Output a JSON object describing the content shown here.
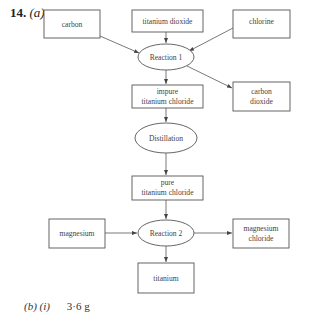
{
  "question": {
    "number": "14.",
    "part": "(a)"
  },
  "diagram": {
    "nodes": {
      "carbon": {
        "label_lines": [
          "carbon"
        ],
        "shape": "box"
      },
      "titanium_dioxide": {
        "label_lines": [
          "titanium dioxide"
        ],
        "shape": "box"
      },
      "chlorine": {
        "label_lines": [
          "chlorine"
        ],
        "shape": "box"
      },
      "reaction1": {
        "label_lines": [
          "Reaction 1"
        ],
        "shape": "ellipse"
      },
      "impure_ticl": {
        "label_lines": [
          "impure",
          "titanium chloride"
        ],
        "shape": "box"
      },
      "carbon_dioxide": {
        "label_lines": [
          "carbon",
          "dioxide"
        ],
        "shape": "box"
      },
      "distillation": {
        "label_lines": [
          "Distillation"
        ],
        "shape": "ellipse"
      },
      "pure_ticl": {
        "label_lines": [
          "pure",
          "titanium chloride"
        ],
        "shape": "box"
      },
      "magnesium": {
        "label_lines": [
          "magnesium"
        ],
        "shape": "box"
      },
      "reaction2": {
        "label_lines": [
          "Reaction 2"
        ],
        "shape": "ellipse"
      },
      "magnesium_chloride": {
        "label_lines": [
          "magnesium",
          "chloride"
        ],
        "shape": "box"
      },
      "titanium": {
        "label_lines": [
          "titanium"
        ],
        "shape": "box"
      }
    },
    "edges": [
      {
        "from": "carbon",
        "to": "reaction1"
      },
      {
        "from": "titanium_dioxide",
        "to": "reaction1"
      },
      {
        "from": "chlorine",
        "to": "reaction1"
      },
      {
        "from": "reaction1",
        "to": "impure_ticl"
      },
      {
        "from": "reaction1",
        "to": "carbon_dioxide"
      },
      {
        "from": "impure_ticl",
        "to": "distillation"
      },
      {
        "from": "distillation",
        "to": "pure_ticl"
      },
      {
        "from": "pure_ticl",
        "to": "reaction2"
      },
      {
        "from": "magnesium",
        "to": "reaction2"
      },
      {
        "from": "reaction2",
        "to": "magnesium_chloride"
      },
      {
        "from": "reaction2",
        "to": "titanium"
      }
    ]
  },
  "answer": {
    "part": "(b)",
    "subpart": "(i)",
    "value": "3·6 g"
  }
}
